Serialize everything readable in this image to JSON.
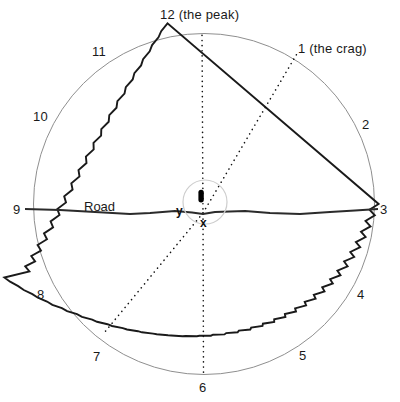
{
  "diagram": {
    "canvas": {
      "width": 400,
      "height": 402
    },
    "circle": {
      "cx": 204,
      "cy": 204,
      "r": 171
    },
    "colors": {
      "outline": "#1a1a1a",
      "smooth_circle": "#8c8c8c",
      "dotted_line": "#1a1a1a",
      "road": "#2b2b2b",
      "inner_circle": "#c9c9c9",
      "blob": "#000000",
      "text": "#1a1a1a",
      "background": "#ffffff"
    },
    "hour_labels": [
      {
        "id": "hour-12",
        "text": "12 (the peak)",
        "x": 160,
        "y": 8
      },
      {
        "id": "hour-1",
        "text": "1 (the crag)",
        "x": 298,
        "y": 42
      },
      {
        "id": "hour-2",
        "text": "2",
        "x": 362,
        "y": 118
      },
      {
        "id": "hour-3",
        "text": "3",
        "x": 380,
        "y": 203
      },
      {
        "id": "hour-4",
        "text": "4",
        "x": 357,
        "y": 288
      },
      {
        "id": "hour-5",
        "text": "5",
        "x": 299,
        "y": 349
      },
      {
        "id": "hour-6",
        "text": "6",
        "x": 199,
        "y": 381
      },
      {
        "id": "hour-7",
        "text": "7",
        "x": 93,
        "y": 350
      },
      {
        "id": "hour-8",
        "text": "8",
        "x": 37,
        "y": 288
      },
      {
        "id": "hour-9",
        "text": "9",
        "x": 13,
        "y": 203
      },
      {
        "id": "hour-10",
        "text": "10",
        "x": 33,
        "y": 110
      },
      {
        "id": "hour-11",
        "text": "11",
        "x": 92,
        "y": 45
      }
    ],
    "annotations": {
      "road": {
        "text": "Road",
        "x": 84,
        "y": 200
      },
      "x_axis": {
        "text": "x",
        "x": 200,
        "y": 217
      },
      "y_axis": {
        "text": "y",
        "x": 176,
        "y": 205
      }
    },
    "center_detail": {
      "inner_circle": {
        "cx": 205,
        "cy": 202,
        "r": 22
      },
      "blob": {
        "cx": 201,
        "cy": 196,
        "rx": 2.6,
        "ry": 6
      }
    },
    "sight_lines": [
      {
        "id": "sight-line-peak",
        "from": "center",
        "to": "12 (the peak)",
        "x1": 203,
        "y1": 213,
        "x2": 202,
        "y2": 34
      },
      {
        "id": "sight-line-six",
        "from": "center",
        "to": "6",
        "x1": 203,
        "y1": 213,
        "x2": 203,
        "y2": 374
      },
      {
        "id": "sight-line-crag",
        "from": "center",
        "to": "1 (the crag)",
        "x1": 203,
        "y1": 213,
        "x2": 297,
        "y2": 53
      },
      {
        "id": "sight-line-seven",
        "from": "center",
        "to": "7",
        "x1": 203,
        "y1": 213,
        "x2": 105,
        "y2": 332
      }
    ],
    "road_line": {
      "x_start": 25,
      "x_end": 378,
      "y": 212
    }
  }
}
